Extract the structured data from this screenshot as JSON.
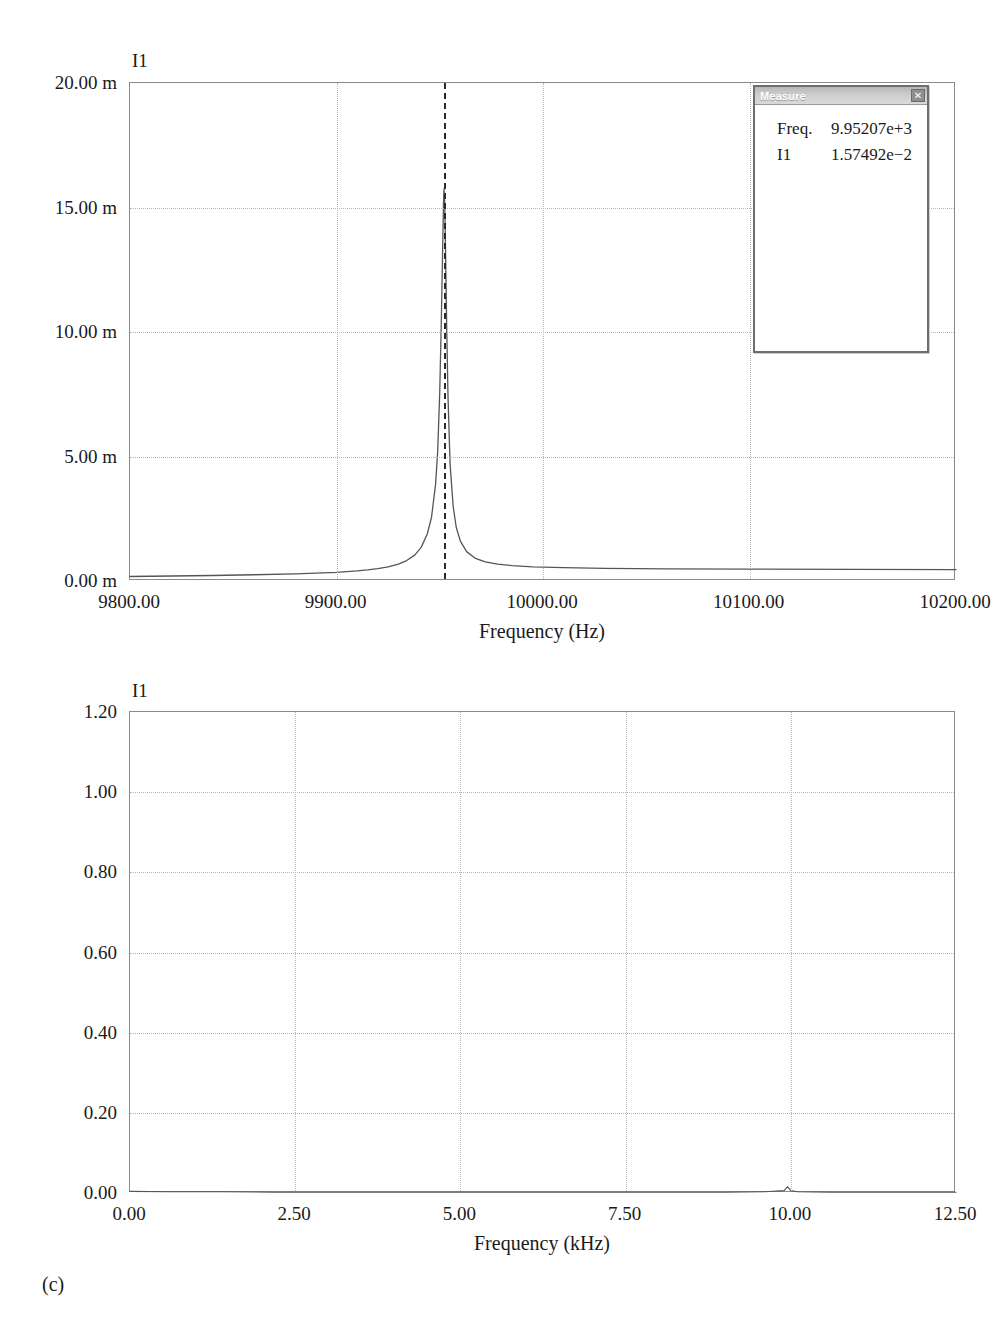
{
  "page": {
    "panel_caption": "(c)"
  },
  "measure_dialog": {
    "title": "Measure",
    "close_label": "✕",
    "rows": [
      {
        "key": "Freq.",
        "value": "9.95207e+3"
      },
      {
        "key": "I1",
        "value": "1.57492e−2"
      }
    ]
  },
  "chart_data": [
    {
      "id": "top",
      "type": "line",
      "title": "",
      "series_label": "I1",
      "xlabel": "Frequency (Hz)",
      "ylabel": "",
      "xlim": [
        9800,
        10200
      ],
      "ylim": [
        0,
        0.02
      ],
      "xticks": [
        9800,
        9900,
        10000,
        10100,
        10200
      ],
      "xticklabels": [
        "9800.00",
        "9900.00",
        "10000.00",
        "10100.00",
        "10200.00"
      ],
      "yticks": [
        0,
        0.005,
        0.01,
        0.015,
        0.02
      ],
      "yticklabels": [
        "0.00 m",
        "5.00 m",
        "10.00 m",
        "15.00 m",
        "20.00 m"
      ],
      "grid": true,
      "cursor_x": 9952.07,
      "cursor_label": "9.95207e+3",
      "peak": {
        "x": 9952.07,
        "y": 0.0157492
      },
      "x": [
        9800,
        9820,
        9840,
        9860,
        9880,
        9890,
        9900,
        9910,
        9915,
        9920,
        9925,
        9930,
        9934,
        9938,
        9941,
        9944,
        9946,
        9948,
        9949,
        9950,
        9950.8,
        9951.4,
        9951.8,
        9952.07,
        9952.4,
        9952.8,
        9953.4,
        9954,
        9955,
        9956.5,
        9958,
        9960,
        9963,
        9967,
        9972,
        9978,
        9985,
        9995,
        10010,
        10030,
        10060,
        10100,
        10150,
        10200
      ],
      "y": [
        0.00018,
        0.0002,
        0.00022,
        0.00025,
        0.00029,
        0.00032,
        0.00035,
        0.00041,
        0.00045,
        0.0005,
        0.00057,
        0.00068,
        0.00082,
        0.00105,
        0.00135,
        0.0019,
        0.00255,
        0.0039,
        0.0052,
        0.0076,
        0.0106,
        0.0133,
        0.0151,
        0.01575,
        0.0152,
        0.0133,
        0.01,
        0.0074,
        0.0047,
        0.003,
        0.00215,
        0.0016,
        0.00118,
        0.00092,
        0.00077,
        0.00068,
        0.00062,
        0.00057,
        0.00054,
        0.00051,
        0.00049,
        0.00048,
        0.00047,
        0.00046
      ]
    },
    {
      "id": "bottom",
      "type": "line",
      "title": "",
      "series_label": "I1",
      "xlabel": "Frequency (kHz)",
      "ylabel": "",
      "xlim": [
        0,
        12.5
      ],
      "ylim": [
        0,
        1.2
      ],
      "xticks": [
        0,
        2.5,
        5,
        7.5,
        10,
        12.5
      ],
      "xticklabels": [
        "0.00",
        "2.50",
        "5.00",
        "7.50",
        "10.00",
        "12.50"
      ],
      "yticks": [
        0,
        0.2,
        0.4,
        0.6,
        0.8,
        1.0,
        1.2
      ],
      "yticklabels": [
        "0.00",
        "0.20",
        "0.40",
        "0.60",
        "0.80",
        "1.00",
        "1.20"
      ],
      "grid": true,
      "x": [
        0,
        0.6,
        1.4,
        2.2,
        3.0,
        4.0,
        5.0,
        6.0,
        7.0,
        8.0,
        9.0,
        9.6,
        9.9,
        9.95,
        10.0,
        10.1,
        10.6,
        11.3,
        12.0,
        12.5
      ],
      "y": [
        0.004,
        0.003,
        0.003,
        0.002,
        0.002,
        0.002,
        0.002,
        0.002,
        0.002,
        0.002,
        0.002,
        0.003,
        0.006,
        0.016,
        0.006,
        0.003,
        0.002,
        0.002,
        0.002,
        0.002
      ]
    }
  ]
}
